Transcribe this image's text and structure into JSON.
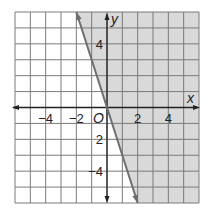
{
  "chart_data": {
    "type": "line",
    "title": "",
    "xlabel": "x",
    "ylabel": "y",
    "origin_label": "O",
    "xlim": [
      -6,
      6
    ],
    "ylim": [
      -6,
      6
    ],
    "grid": true,
    "x_tick_labels": [
      {
        "value": -4,
        "label": "−4"
      },
      {
        "value": -2,
        "label": "−2"
      },
      {
        "value": 2,
        "label": "2"
      },
      {
        "value": 4,
        "label": "4"
      }
    ],
    "y_tick_labels": [
      {
        "value": 4,
        "label": "4"
      },
      {
        "value": -2,
        "label": "2"
      },
      {
        "value": -4,
        "label": "−4"
      }
    ],
    "series": [
      {
        "name": "boundary line",
        "equation": "y = -3x",
        "style": "solid",
        "x": [
          -2,
          0,
          2
        ],
        "y": [
          6,
          0,
          -6
        ]
      }
    ],
    "shaded_region": {
      "description": "right of the line",
      "inequality": "y > -3x (or y >= -3x)",
      "color": "#d9d9d9"
    },
    "colors": {
      "grid": "#7a7a7a",
      "axis": "#222222",
      "line": "#6e6e6e",
      "shade": "#d9d9d9"
    }
  }
}
